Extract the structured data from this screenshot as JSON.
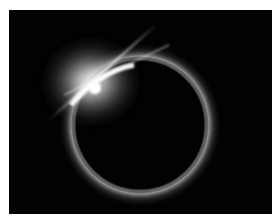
{
  "image": {
    "subject": "Total solar eclipse diamond ring effect",
    "alt": "Solar eclipse with bright diamond ring flare at upper left of the moon's silhouette",
    "colors": {
      "background": "#020202",
      "frame": "#ffffff",
      "corona": "#d8d8d8",
      "flare": "#ffffff"
    }
  }
}
